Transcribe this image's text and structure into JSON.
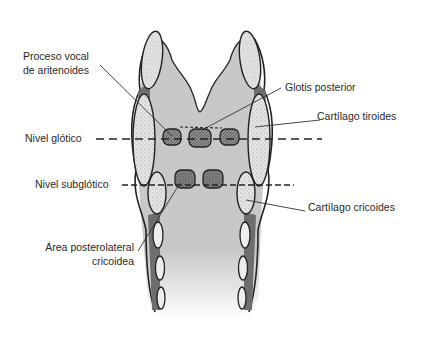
{
  "diagram": {
    "title": "",
    "colors": {
      "tissue": "#c8c8c8",
      "cartilage_fill": "#e2e2e2",
      "dark_band": "#6e6e6e",
      "outline": "#222222",
      "arytenoid_fill": "#8a8a8a"
    },
    "labels": {
      "proceso_vocal_line1": "Proceso vocal",
      "proceso_vocal_line2": "de aritenoides",
      "glotis_posterior": "Glotis posterior",
      "cartilago_tiroides": "Cartílago tiroides",
      "nivel_glotico": "Nivel glótico",
      "nivel_subglotico": "Nivel subglótico",
      "cartilago_cricoides": "Cartílago cricoides",
      "area_posterolateral_line1": "Área posterolateral",
      "area_posterolateral_line2": "cricoidea"
    }
  }
}
